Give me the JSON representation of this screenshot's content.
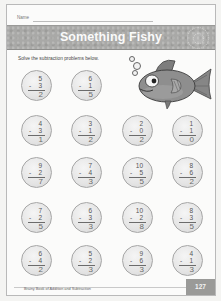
{
  "header": {
    "name_label": "Name"
  },
  "banner": {
    "title": "Something Fishy"
  },
  "instructions": "Solve the subtraction problems below.",
  "illustration": {
    "subject": "fish-icon",
    "bubbles": 3
  },
  "problems": [
    {
      "top": "5",
      "sub": "3",
      "answer": "2"
    },
    {
      "top": "6",
      "sub": "1",
      "answer": "5"
    },
    {
      "top": "4",
      "sub": "3",
      "answer": "1"
    },
    {
      "top": "3",
      "sub": "1",
      "answer": "2"
    },
    {
      "top": "2",
      "sub": "0",
      "answer": "2"
    },
    {
      "top": "1",
      "sub": "1",
      "answer": "0"
    },
    {
      "top": "9",
      "sub": "2",
      "answer": "7"
    },
    {
      "top": "7",
      "sub": "4",
      "answer": "3"
    },
    {
      "top": "10",
      "sub": "5",
      "answer": "5"
    },
    {
      "top": "8",
      "sub": "6",
      "answer": "2"
    },
    {
      "top": "7",
      "sub": "2",
      "answer": "5"
    },
    {
      "top": "6",
      "sub": "3",
      "answer": "3"
    },
    {
      "top": "10",
      "sub": "2",
      "answer": "8"
    },
    {
      "top": "8",
      "sub": "3",
      "answer": "5"
    },
    {
      "top": "6",
      "sub": "4",
      "answer": "2"
    },
    {
      "top": "5",
      "sub": "2",
      "answer": "3"
    },
    {
      "top": "9",
      "sub": "6",
      "answer": "3"
    },
    {
      "top": "4",
      "sub": "1",
      "answer": "3"
    }
  ],
  "minus_sign": "-",
  "footer": {
    "book_title": "Brainy Book of Addition and Subtraction",
    "page_number": "127"
  },
  "colors": {
    "banner": "#a9a9a7",
    "page_tab": "#9a9a98",
    "circle": "#e4e4e4"
  }
}
